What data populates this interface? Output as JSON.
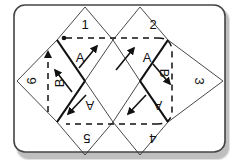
{
  "diagram": {
    "panels": [
      {
        "number": "1",
        "letter": "A",
        "rotation": 0
      },
      {
        "number": "2",
        "letter": "A",
        "rotation": 0
      },
      {
        "number": "3",
        "letter": "B",
        "rotation": 90
      },
      {
        "number": "4",
        "letter": "A",
        "rotation": 180
      },
      {
        "number": "5",
        "letter": "A",
        "rotation": 180
      },
      {
        "number": "6",
        "letter": "B",
        "rotation": -90
      }
    ],
    "colors": {
      "line": "#111111",
      "thin_line": "#333333",
      "card_border": "#444444",
      "shadow": "#9a9a9a",
      "background": "#ffffff"
    }
  }
}
